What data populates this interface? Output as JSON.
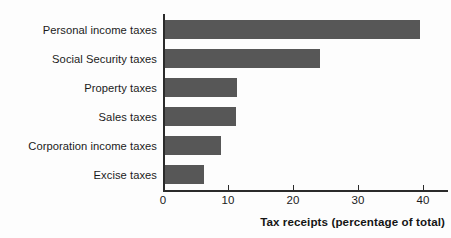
{
  "chart_data": {
    "type": "bar",
    "orientation": "horizontal",
    "title": "",
    "xlabel": "Tax receipts (percentage of total)",
    "ylabel": "",
    "categories": [
      "Personal income taxes",
      "Social Security taxes",
      "Property taxes",
      "Sales taxes",
      "Corporation income taxes",
      "Excise taxes"
    ],
    "values": [
      39.5,
      24.1,
      11.4,
      11.2,
      8.9,
      6.3
    ],
    "xlim": [
      0,
      42
    ],
    "xticks": [
      0,
      10,
      20,
      30,
      40
    ],
    "xtick_labels": [
      "0",
      "10",
      "20",
      "30",
      "40"
    ],
    "grid": false,
    "legend": null,
    "bar_color": "#575757",
    "axis_color": "#2b2b2b",
    "background_color": "#fdfdfd"
  }
}
